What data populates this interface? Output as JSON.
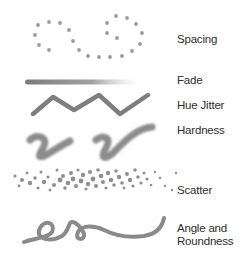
{
  "labels": {
    "spacing": "Spacing",
    "fade": "Fade",
    "hue_jitter": "Hue Jitter",
    "hardness": "Hardness",
    "scatter": "Scatter",
    "angle_line1": "Angle and",
    "angle_line2": "Roundness"
  },
  "colors": {
    "stroke": "#8a8a8a",
    "dot": "#999999",
    "text": "#2e2e2e"
  }
}
